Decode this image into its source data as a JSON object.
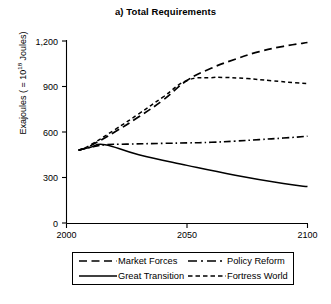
{
  "chart_data": {
    "type": "line",
    "title": "a) Total Requirements",
    "xlabel": "",
    "ylabel": "Exajoules ( = 10^18 Joules)",
    "ylabel_prefix": "Exajoules ( = 10",
    "ylabel_exponent": "18",
    "ylabel_suffix": " Joules)",
    "xlim": [
      2000,
      2100
    ],
    "ylim": [
      0,
      1200
    ],
    "xticks": [
      2000,
      2050,
      2100
    ],
    "xtick_labels": [
      "2000",
      "2050",
      "2100"
    ],
    "yticks": [
      0,
      300,
      600,
      900,
      1200
    ],
    "ytick_labels": [
      "0",
      "300",
      "600",
      "900",
      "1,200"
    ],
    "grid": false,
    "legend_position": "below-outside",
    "series": [
      {
        "name": "Market Forces",
        "style": "long-dash",
        "x": [
          2005,
          2010,
          2020,
          2030,
          2040,
          2050,
          2060,
          2070,
          2080,
          2090,
          2100
        ],
        "values": [
          480,
          510,
          600,
          700,
          810,
          940,
          1020,
          1080,
          1130,
          1165,
          1190
        ]
      },
      {
        "name": "Policy Reform",
        "style": "dash-dot",
        "x": [
          2005,
          2010,
          2016,
          2025,
          2040,
          2050,
          2060,
          2070,
          2080,
          2090,
          2100
        ],
        "values": [
          480,
          500,
          516,
          520,
          525,
          528,
          532,
          540,
          550,
          560,
          572
        ]
      },
      {
        "name": "Great Transition",
        "style": "solid",
        "x": [
          2005,
          2010,
          2016,
          2030,
          2050,
          2070,
          2090,
          2100
        ],
        "values": [
          480,
          500,
          516,
          450,
          380,
          315,
          260,
          240
        ]
      },
      {
        "name": "Fortress World",
        "style": "short-dash",
        "x": [
          2005,
          2010,
          2020,
          2030,
          2040,
          2050,
          2060,
          2065,
          2075,
          2085,
          2095,
          2100
        ],
        "values": [
          480,
          515,
          615,
          720,
          830,
          940,
          958,
          960,
          952,
          938,
          925,
          920
        ]
      }
    ]
  },
  "legend": {
    "rows": [
      [
        {
          "label": "Market Forces",
          "style": "long-dash"
        },
        {
          "label": "Policy Reform",
          "style": "dash-dot"
        }
      ],
      [
        {
          "label": "Great Transition",
          "style": "solid"
        },
        {
          "label": "Fortress World",
          "style": "short-dash"
        }
      ]
    ]
  },
  "colors": {
    "ink": "#000000",
    "background": "#ffffff"
  }
}
